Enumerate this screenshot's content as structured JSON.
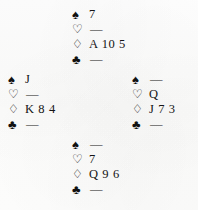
{
  "diagram": {
    "layout": "compass",
    "background_color": "#fdfdfd",
    "text_color": "#1a1a1a"
  },
  "suits": {
    "spade": {
      "name": "spade-symbol",
      "glyph": "♠",
      "style": "filled",
      "color": "#111111"
    },
    "heart": {
      "name": "heart-symbol",
      "glyph": "♡",
      "style": "outline",
      "color": "#111111"
    },
    "diamond": {
      "name": "diamond-symbol",
      "glyph": "♢",
      "style": "outline",
      "color": "#111111"
    },
    "club": {
      "name": "club-symbol",
      "glyph": "♣",
      "style": "filled",
      "color": "#111111"
    }
  },
  "void_marker": "—",
  "hands": {
    "north": {
      "position_label": "North",
      "spades": "7",
      "hearts": "—",
      "diamonds": "A 10 5",
      "clubs": "—"
    },
    "west": {
      "position_label": "West",
      "spades": "J",
      "hearts": "—",
      "diamonds": "K 8 4",
      "clubs": "—"
    },
    "east": {
      "position_label": "East",
      "spades": "—",
      "hearts": "Q",
      "diamonds": "J 7 3",
      "clubs": "—"
    },
    "south": {
      "position_label": "South",
      "spades": "—",
      "hearts": "7",
      "diamonds": "Q 9 6",
      "clubs": "—"
    }
  }
}
